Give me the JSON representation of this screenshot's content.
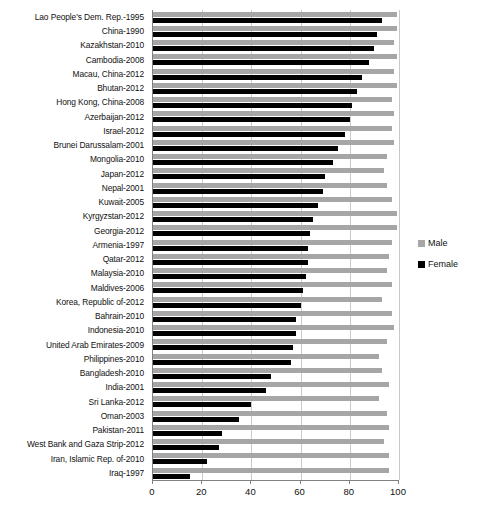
{
  "chart_data": {
    "type": "bar",
    "orientation": "horizontal",
    "title": "",
    "subtitle": "",
    "xlabel": "",
    "ylabel": "",
    "xlim": [
      0,
      100
    ],
    "xticks": [
      0,
      20,
      40,
      60,
      80,
      100
    ],
    "xtick_labels": [
      "0",
      "20",
      "40",
      "60",
      "80",
      "100"
    ],
    "grid": true,
    "legend_position": "right",
    "colors": {
      "male": "#a6a6a6",
      "female": "#000000",
      "gridline": "#c9c9c9",
      "axis": "#808080"
    },
    "legend": [
      {
        "name": "Male",
        "color": "#a6a6a6"
      },
      {
        "name": "Female",
        "color": "#000000"
      }
    ],
    "categories": [
      "Lao People's Dem. Rep.-1995",
      "China-1990",
      "Kazakhstan-2010",
      "Cambodia-2008",
      "Macau, China-2012",
      "Bhutan-2012",
      "Hong Kong, China-2008",
      "Azerbaijan-2012",
      "Israel-2012",
      "Brunei Darussalam-2001",
      "Mongolia-2010",
      "Japan-2012",
      "Nepal-2001",
      "Kuwait-2005",
      "Kyrgyzstan-2012",
      "Georgia-2012",
      "Armenia-1997",
      "Qatar-2012",
      "Malaysia-2010",
      "Maldives-2006",
      "Korea, Republic of-2012",
      "Bahrain-2010",
      "Indonesia-2010",
      "United Arab Emirates-2009",
      "Philippines-2010",
      "Bangladesh-2010",
      "India-2001",
      "Sri Lanka-2012",
      "Oman-2003",
      "Pakistan-2011",
      "West Bank and Gaza Strip-2012",
      "Iran, Islamic Rep. of-2010",
      "Iraq-1997"
    ],
    "series": [
      {
        "name": "Male",
        "color": "#a6a6a6",
        "values": [
          99,
          99,
          98,
          99,
          98,
          99,
          97,
          98,
          97,
          98,
          95,
          94,
          95,
          97,
          99,
          99,
          97,
          96,
          95,
          97,
          93,
          97,
          98,
          95,
          92,
          93,
          96,
          92,
          95,
          96,
          94,
          96,
          96
        ]
      },
      {
        "name": "Female",
        "color": "#000000",
        "values": [
          93,
          91,
          90,
          88,
          85,
          83,
          81,
          80,
          78,
          75,
          73,
          70,
          69,
          67,
          65,
          64,
          63,
          63,
          62,
          61,
          60,
          58,
          58,
          57,
          56,
          48,
          46,
          40,
          35,
          28,
          27,
          22,
          15
        ]
      }
    ]
  }
}
